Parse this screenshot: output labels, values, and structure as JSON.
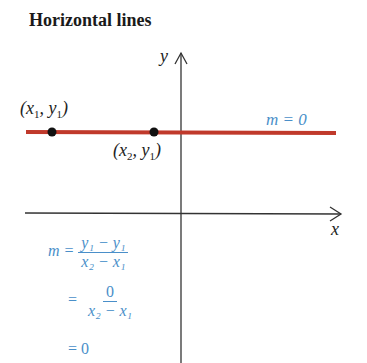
{
  "title": "Horizontal lines",
  "axes": {
    "x_label": "x",
    "y_label": "y"
  },
  "line": {
    "label": "m = 0",
    "color": "#c0392b"
  },
  "points": [
    {
      "label_var1": "x",
      "label_sub1": "1",
      "label_var2": "y",
      "label_sub2": "1"
    },
    {
      "label_var1": "x",
      "label_sub1": "2",
      "label_var2": "y",
      "label_sub2": "1"
    }
  ],
  "equation": {
    "line1": {
      "lhs": "m =",
      "num": "y₁ − y₁",
      "den": "x₂ − x₁"
    },
    "line2": {
      "lhs": "=",
      "num": "0",
      "den": "x₂ − x₁"
    },
    "line3": "= 0"
  },
  "colors": {
    "accent_blue": "#4a8fc9",
    "line_red": "#c0392b",
    "axis": "#333333"
  }
}
